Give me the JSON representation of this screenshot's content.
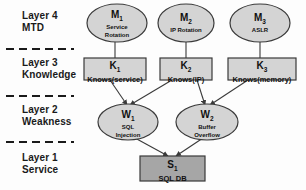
{
  "figure": {
    "background_color": "#fdfdfd",
    "node_fill": "#d4d4d4",
    "service_fill": "#a6a6a6",
    "stroke_color": "#3a3a3a",
    "divider_color": "#1a1a1a"
  },
  "layers": [
    {
      "id": "layer4",
      "number": "Layer 4",
      "name": "MTD"
    },
    {
      "id": "layer3",
      "number": "Layer 3",
      "name": "Knowledge"
    },
    {
      "id": "layer2",
      "number": "Layer 2",
      "name": "Weakness"
    },
    {
      "id": "layer1",
      "number": "Layer 1",
      "name": "Service"
    }
  ],
  "nodes": {
    "mtd": [
      {
        "id": "M",
        "index": "1",
        "label": "Service Rotation",
        "line1": "Service",
        "line2": "Rotation",
        "shape": "ellipse"
      },
      {
        "id": "M",
        "index": "2",
        "label": "IP Rotation",
        "line1": "IP Rotation",
        "line2": "",
        "shape": "ellipse"
      },
      {
        "id": "M",
        "index": "3",
        "label": "ASLR",
        "line1": "ASLR",
        "line2": "",
        "shape": "ellipse"
      }
    ],
    "knowledge": [
      {
        "id": "K",
        "index": "1",
        "label": "Knows(service)",
        "shape": "rect"
      },
      {
        "id": "K",
        "index": "2",
        "label": "Knows(IP)",
        "shape": "rect"
      },
      {
        "id": "K",
        "index": "3",
        "label": "Knows(memory)",
        "shape": "rect"
      }
    ],
    "weakness": [
      {
        "id": "W",
        "index": "1",
        "label": "SQL Injection",
        "line1": "SQL",
        "line2": "Injection",
        "shape": "ellipse"
      },
      {
        "id": "W",
        "index": "2",
        "label": "Buffer Overflow",
        "line1": "Buffer",
        "line2": "Overflow",
        "shape": "ellipse"
      }
    ],
    "service": [
      {
        "id": "S",
        "index": "1",
        "label": "SQL DB",
        "shape": "rect"
      }
    ]
  },
  "edges": [
    {
      "from": "M1",
      "to": "K1"
    },
    {
      "from": "M2",
      "to": "K2"
    },
    {
      "from": "M3",
      "to": "K3"
    },
    {
      "from": "K1",
      "to": "W1"
    },
    {
      "from": "K2",
      "to": "W1"
    },
    {
      "from": "K2",
      "to": "W2"
    },
    {
      "from": "K3",
      "to": "W2"
    },
    {
      "from": "W1",
      "to": "S1"
    },
    {
      "from": "W2",
      "to": "S1"
    }
  ]
}
